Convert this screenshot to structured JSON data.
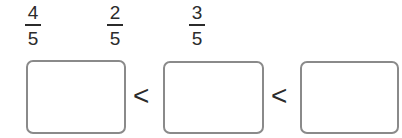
{
  "fractions": [
    {
      "numerator": "4",
      "denominator": "5"
    },
    {
      "numerator": "2",
      "denominator": "5"
    },
    {
      "numerator": "3",
      "denominator": "5"
    }
  ],
  "answer_boxes": [
    {
      "value": ""
    },
    {
      "value": ""
    },
    {
      "value": ""
    }
  ],
  "comparison_symbols": [
    "<",
    "<"
  ],
  "colors": {
    "box_border": "#8a8a8a",
    "text": "#2b2b2b"
  }
}
